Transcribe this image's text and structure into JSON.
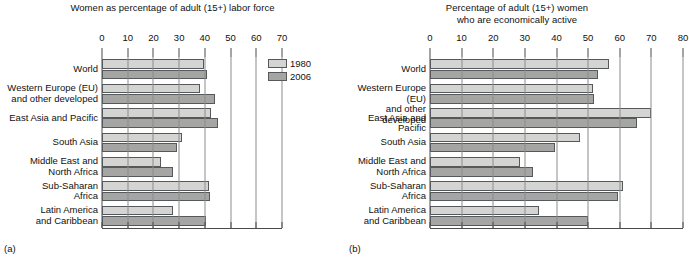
{
  "figure": {
    "panel_a_tag": "(a)",
    "panel_b_tag": "(b)",
    "legend": [
      {
        "label": "1980",
        "color": "#d4d4d2"
      },
      {
        "label": "2006",
        "color": "#a5a5a3"
      }
    ]
  },
  "chart_data": [
    {
      "type": "bar",
      "panel": "(a)",
      "title": "Women as percentage of adult (15+) labor force",
      "title_line1": "Women as percentage of adult (15+) labor force",
      "title_line2": "",
      "orientation": "horizontal",
      "xlabel": "",
      "ylabel": "",
      "xlim": [
        0,
        70
      ],
      "xticks": [
        0,
        10,
        20,
        30,
        40,
        50,
        60,
        70
      ],
      "grid": true,
      "legend_position": "inside-right",
      "categories": [
        "World",
        "Western Europe (EU)\nand other developed",
        "East Asia and Pacific",
        "South Asia",
        "Middle East and\nNorth Africa",
        "Sub-Saharan\nAfrica",
        "Latin America\nand Caribbean"
      ],
      "series": [
        {
          "name": "1980",
          "color": "#d4d4d2",
          "values": [
            39.5,
            38,
            42.5,
            31,
            23,
            41.5,
            27.5
          ]
        },
        {
          "name": "2006",
          "color": "#a5a5a3",
          "values": [
            41,
            44,
            45,
            29,
            27.5,
            42,
            40.5
          ]
        }
      ]
    },
    {
      "type": "bar",
      "panel": "(b)",
      "title": "Percentage of adult (15+) women who are economically active",
      "title_line1": "Percentage of adult (15+) women",
      "title_line2": "who are economically active",
      "orientation": "horizontal",
      "xlabel": "",
      "ylabel": "",
      "xlim": [
        0,
        80
      ],
      "xticks": [
        0,
        10,
        20,
        30,
        40,
        50,
        60,
        70,
        80
      ],
      "grid": true,
      "legend_position": "none",
      "categories": [
        "World",
        "Western Europe (EU)\nand other developed",
        "East Asia and Pacific",
        "South Asia",
        "Middle East and\nNorth Africa",
        "Sub-Saharan\nAfrica",
        "Latin America\nand Caribbean"
      ],
      "series": [
        {
          "name": "1980",
          "color": "#d4d4d2",
          "values": [
            56.5,
            51.5,
            70,
            47.5,
            28.5,
            61,
            34.5
          ]
        },
        {
          "name": "2006",
          "color": "#a5a5a3",
          "values": [
            53,
            52,
            65.5,
            39.5,
            32.5,
            59.5,
            50
          ]
        }
      ]
    }
  ]
}
